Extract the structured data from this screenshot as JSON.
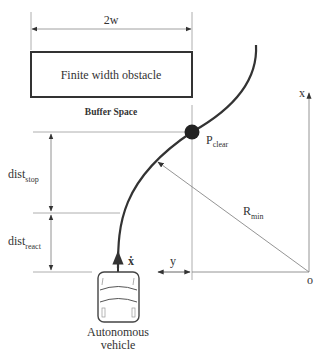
{
  "diagram": {
    "width_label": "2w",
    "obstacle_label": "Finite width obstacle",
    "buffer_label": "Buffer Space",
    "point_label": {
      "main": "P",
      "sub": "clear"
    },
    "radius_label": {
      "main": "R",
      "sub": "min"
    },
    "dist_stop_label": {
      "main": "dist",
      "sub": "stop"
    },
    "dist_react_label": {
      "main": "dist",
      "sub": "react"
    },
    "velocity_label": "ẋ",
    "y_label": "y",
    "x_axis_label": "x",
    "origin_label": "o",
    "vehicle_label_line1": "Autonomous",
    "vehicle_label_line2": "vehicle"
  },
  "colors": {
    "line": "#333333",
    "thin_line": "#888888",
    "point": "#222222"
  }
}
